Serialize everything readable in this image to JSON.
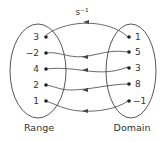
{
  "diagram": {
    "mapping_label": "s⁻¹",
    "range_caption": "Range",
    "domain_caption": "Domain",
    "range_values": [
      "3",
      "−2",
      "4",
      "2",
      "1"
    ],
    "domain_values": [
      "1",
      "5",
      "3",
      "8",
      "−1"
    ],
    "pairs": [
      {
        "from": "1",
        "to": "3"
      },
      {
        "from": "5",
        "to": "−2"
      },
      {
        "from": "3",
        "to": "4"
      },
      {
        "from": "8",
        "to": "2"
      },
      {
        "from": "−1",
        "to": "1"
      }
    ],
    "colors": {
      "line": "#333333",
      "background": "#ffffff"
    }
  }
}
